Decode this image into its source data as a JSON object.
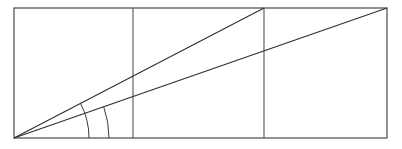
{
  "figure": {
    "background_color": "#ffffff",
    "stroke_color": "#3a3a3a",
    "ray_color": "#2e2e2e",
    "divider_color": "#555555",
    "canvas": {
      "width": 402,
      "height": 149
    },
    "rectangle": {
      "label": "outer rectangle",
      "left": 14,
      "top": 8,
      "right": 387,
      "bottom": 138,
      "width": 373,
      "height": 130
    },
    "vertex": {
      "label": "common vertex",
      "x": 14,
      "y": 138
    },
    "cells": {
      "count": 3,
      "labels": [
        "cell-1",
        "cell-2",
        "cell-3"
      ]
    },
    "dividers": [
      {
        "label": "divider-1",
        "x": 133,
        "top": 8,
        "bottom": 138
      },
      {
        "label": "divider-2",
        "x": 264,
        "top": 8,
        "bottom": 138
      }
    ],
    "rays": [
      {
        "label": "upper-ray",
        "from_x": 14,
        "from_y": 138,
        "to_x": 264,
        "to_y": 8,
        "endpoint_note": "top of divider-2",
        "slope_run": 250,
        "slope_rise": 130
      },
      {
        "label": "lower-ray",
        "from_x": 14,
        "from_y": 138,
        "to_x": 387,
        "to_y": 8,
        "endpoint_note": "top-right corner of rectangle",
        "slope_run": 373,
        "slope_rise": 130
      }
    ],
    "baseline": {
      "label": "baseline",
      "from_x": 14,
      "from_y": 138,
      "to_x": 387,
      "to_y": 138
    },
    "arcs": [
      {
        "label": "inner-arc",
        "radius": 75,
        "center_x": 14,
        "center_y": 138,
        "spans": "baseline to upper-ray"
      },
      {
        "label": "outer-arc",
        "radius": 95,
        "center_x": 14,
        "center_y": 138,
        "spans": "baseline to lower-ray"
      }
    ]
  }
}
